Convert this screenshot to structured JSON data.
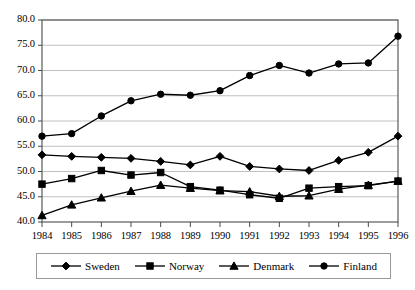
{
  "chart_data": {
    "type": "line",
    "title": "",
    "subtitle": "",
    "xlabel": "",
    "ylabel": "",
    "x": [
      1984,
      1985,
      1986,
      1987,
      1988,
      1989,
      1990,
      1991,
      1992,
      1993,
      1994,
      1995,
      1996
    ],
    "categories": [
      "1984",
      "1985",
      "1986",
      "1987",
      "1988",
      "1989",
      "1990",
      "1991",
      "1992",
      "1993",
      "1994",
      "1995",
      "1996"
    ],
    "xlim": [
      1984,
      1996
    ],
    "ylim": [
      40.0,
      80.0
    ],
    "ytick_labels": [
      "40.0",
      "45.0",
      "50.0",
      "55.0",
      "60.0",
      "65.0",
      "70.0",
      "75.0",
      "80.0"
    ],
    "ytick_values": [
      40.0,
      45.0,
      50.0,
      55.0,
      60.0,
      65.0,
      70.0,
      75.0,
      80.0
    ],
    "grid": true,
    "grid_axis": "y",
    "legend_position": "bottom",
    "series": [
      {
        "name": "Sweden",
        "marker": "diamond",
        "color": "#000000",
        "values": [
          53.3,
          53.0,
          52.8,
          52.6,
          52.0,
          51.3,
          53.0,
          51.0,
          50.5,
          50.2,
          52.2,
          53.8,
          57.0
        ]
      },
      {
        "name": "Norway",
        "marker": "square",
        "color": "#000000",
        "values": [
          47.5,
          48.6,
          50.2,
          49.3,
          49.8,
          47.0,
          46.3,
          45.4,
          44.7,
          46.7,
          47.0,
          47.2,
          48.1
        ]
      },
      {
        "name": "Denmark",
        "marker": "triangle",
        "color": "#000000",
        "values": [
          41.3,
          43.4,
          44.8,
          46.1,
          47.3,
          46.7,
          46.2,
          46.0,
          45.1,
          45.2,
          46.5,
          47.3,
          48.1
        ]
      },
      {
        "name": "Finland",
        "marker": "circle",
        "color": "#000000",
        "values": [
          57.0,
          57.5,
          61.0,
          64.0,
          65.3,
          65.1,
          66.0,
          69.0,
          71.0,
          69.5,
          71.3,
          71.5,
          76.8
        ]
      }
    ]
  },
  "legend": {
    "entries": [
      {
        "label": "Sweden",
        "marker": "diamond"
      },
      {
        "label": "Norway",
        "marker": "square"
      },
      {
        "label": "Denmark",
        "marker": "triangle"
      },
      {
        "label": "Finland",
        "marker": "circle"
      }
    ]
  }
}
